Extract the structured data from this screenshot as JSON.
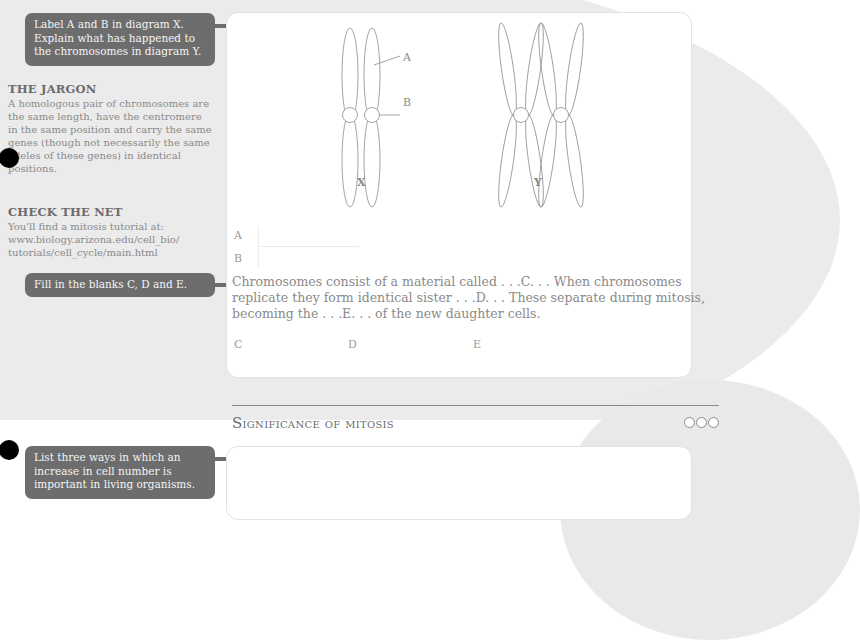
{
  "callouts": {
    "q1": "Label A and B in diagram X. Explain what has happened to the chromosomes in diagram Y.",
    "q2": "Fill in the blanks C, D and E.",
    "q3": "List three ways in which an increase in cell number is important in living organisms."
  },
  "sidebar": {
    "jargon": {
      "heading": "THE JARGON",
      "text": "A homologous pair of chromosomes are the same length, have the centromere in the same position and carry the same genes (though not necessarily the same alleles of these genes) in identical positions."
    },
    "check_net": {
      "heading": "CHECK THE NET",
      "text": "You'll find a mitosis tutorial at: www.biology.arizona.edu/cell_bio/ tutorials/cell_cycle/main.html"
    }
  },
  "diagram": {
    "label_a": "A",
    "label_b": "B",
    "caption_x": "X",
    "caption_y": "Y"
  },
  "answers_ab": {
    "a": "A",
    "b": "B"
  },
  "paragraph": "Chromosomes consist of a material called . . .C. . . When chromosomes replicate they form identical sister . . .D. . . These separate during mitosis, becoming the . . .E. . . of the new daughter cells.",
  "answers_cde": {
    "c": "C",
    "d": "D",
    "e": "E"
  },
  "section": {
    "title_first": "S",
    "title_rest": "ignificance of mitosis",
    "difficulty_dots": 3
  },
  "colors": {
    "callout_bg": "#6d6d6d",
    "background_shape": "#ebebeb",
    "text": "#8a8a8a"
  }
}
